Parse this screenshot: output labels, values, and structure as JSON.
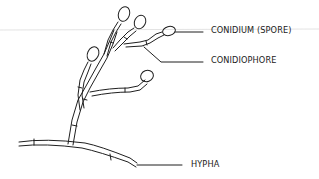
{
  "diagram": {
    "labels": [
      {
        "id": "conidium",
        "text": "CONIDIUM (SPORE)",
        "x": 211,
        "y": 26
      },
      {
        "id": "conidiophore",
        "text": "CONIDIOPHORE",
        "x": 211,
        "y": 56
      },
      {
        "id": "hypha",
        "text": "HYPHA",
        "x": 191,
        "y": 153
      }
    ],
    "colors": {
      "line": "#1f1f1f",
      "scan_line": "#d8d8d8",
      "background": "#ffffff"
    }
  }
}
